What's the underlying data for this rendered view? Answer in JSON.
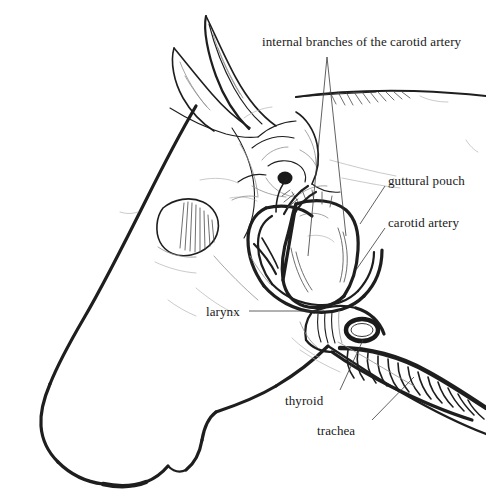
{
  "figure": {
    "medium": "pencil-line-drawing",
    "background_color": "#ffffff",
    "ink_color": "#1a1a1a",
    "canvas": {
      "width": 486,
      "height": 500
    }
  },
  "labels": {
    "internal_branches": "internal branches of the carotid artery",
    "guttural_pouch": "guttural pouch",
    "carotid_artery": "carotid artery",
    "larynx": "larynx",
    "thyroid": "thyroid",
    "trachea": "trachea"
  },
  "structures": [
    {
      "name": "ear-left",
      "label": null
    },
    {
      "name": "ear-right",
      "label": null
    },
    {
      "name": "eye",
      "label": null
    },
    {
      "name": "muzzle",
      "label": null
    },
    {
      "name": "jaw-outline",
      "label": null
    },
    {
      "name": "mane-crest",
      "label": null
    },
    {
      "name": "guttural-pouch",
      "label": "guttural pouch"
    },
    {
      "name": "carotid-artery",
      "label": "carotid artery"
    },
    {
      "name": "internal-carotid-branches",
      "label": "internal branches of the carotid artery"
    },
    {
      "name": "larynx",
      "label": "larynx"
    },
    {
      "name": "thyroid-gland",
      "label": "thyroid"
    },
    {
      "name": "trachea",
      "label": "trachea"
    }
  ],
  "leader_lines": [
    {
      "name": "leader-internal-branches-a",
      "from": [
        327,
        57
      ],
      "to": [
        308,
        255
      ]
    },
    {
      "name": "leader-internal-branches-b",
      "from": [
        327,
        57
      ],
      "to": [
        345,
        235
      ]
    },
    {
      "name": "leader-guttural-pouch",
      "from": [
        385,
        186
      ],
      "to": [
        362,
        222
      ]
    },
    {
      "name": "leader-carotid-artery",
      "from": [
        385,
        228
      ],
      "to": [
        358,
        268
      ]
    },
    {
      "name": "leader-larynx",
      "from": [
        249,
        311
      ],
      "to": [
        322,
        311
      ]
    },
    {
      "name": "leader-thyroid",
      "from": [
        340,
        390
      ],
      "to": [
        362,
        340
      ]
    },
    {
      "name": "leader-trachea",
      "from": [
        372,
        420
      ],
      "to": [
        412,
        378
      ]
    }
  ]
}
